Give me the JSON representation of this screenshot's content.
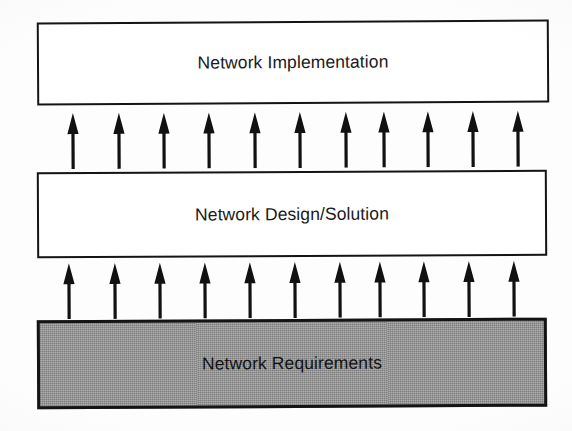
{
  "diagram": {
    "background_color": "#fdfdfd",
    "layers": [
      {
        "id": "implementation",
        "label": "Network Implementation",
        "fill": "#ffffff",
        "border_color": "#141414"
      },
      {
        "id": "design",
        "label": "Network Design/Solution",
        "fill": "#ffffff",
        "border_color": "#141414"
      },
      {
        "id": "requirements",
        "label": "Network Requirements",
        "fill": "#9b9b9b",
        "border_color": "#121212"
      }
    ],
    "arrow_rows": [
      {
        "id": "design-to-implementation",
        "direction": "up",
        "count": 11,
        "color": "#111111",
        "positions": [
          64,
          110,
          155,
          200,
          246,
          291,
          337,
          375,
          419,
          464,
          509
        ]
      },
      {
        "id": "requirements-to-design",
        "direction": "up",
        "count": 11,
        "color": "#111111",
        "positions": [
          60,
          106,
          151,
          196,
          241,
          286,
          331,
          371,
          415,
          460,
          505
        ]
      }
    ]
  }
}
